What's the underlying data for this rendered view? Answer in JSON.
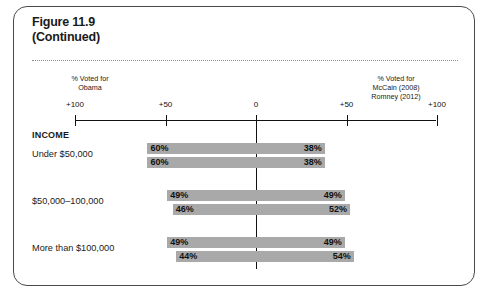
{
  "figure": {
    "title_line1": "Figure 11.9",
    "title_line2": "(Continued)"
  },
  "axis": {
    "caption_left": "% Voted for\nObama",
    "caption_right": "% Voted for\nMcCain (2008)\nRomney (2012)",
    "ticks": [
      {
        "label": "+100",
        "value": -100
      },
      {
        "label": "+50",
        "value": -50
      },
      {
        "label": "0",
        "value": 0
      },
      {
        "label": "+50",
        "value": 50
      },
      {
        "label": "+100",
        "value": 100
      }
    ]
  },
  "section": {
    "heading": "INCOME"
  },
  "chart_data": {
    "type": "bar",
    "title": "Figure 11.9 (Continued)",
    "xlabel": "",
    "ylabel": "",
    "xlim": [
      -100,
      100
    ],
    "grid": false,
    "legend": "none",
    "orientation": "horizontal-diverging",
    "left_side_label": "% Voted for Obama",
    "right_side_label": "% Voted for McCain (2008) / Romney (2012)",
    "tick_labels": [
      "+100",
      "+50",
      "0",
      "+50",
      "+100"
    ],
    "groups": [
      {
        "category": "Under $50,000",
        "rows": [
          {
            "left_value": 60,
            "left_label": "60%",
            "right_value": 38,
            "right_label": "38%"
          },
          {
            "left_value": 60,
            "left_label": "60%",
            "right_value": 38,
            "right_label": "38%"
          }
        ]
      },
      {
        "category": "$50,000–100,000",
        "rows": [
          {
            "left_value": 49,
            "left_label": "49%",
            "right_value": 49,
            "right_label": "49%"
          },
          {
            "left_value": 46,
            "left_label": "46%",
            "right_value": 52,
            "right_label": "52%"
          }
        ]
      },
      {
        "category": "More than $100,000",
        "rows": [
          {
            "left_value": 49,
            "left_label": "49%",
            "right_value": 49,
            "right_label": "49%"
          },
          {
            "left_value": 44,
            "left_label": "44%",
            "right_value": 54,
            "right_label": "54%"
          }
        ]
      }
    ],
    "bar_color": "#a9a9a9"
  }
}
